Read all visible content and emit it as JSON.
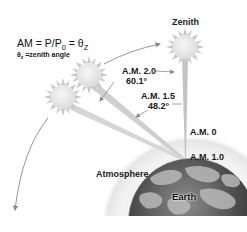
{
  "formula": {
    "main": "AM = P/P",
    "main_sub": "0",
    "main_tail": " = θ",
    "main_tail_sub": "Z",
    "definition_symbol": "θ",
    "definition_symbol_sub": "z",
    "definition_text": " =zenith angle"
  },
  "labels": {
    "zenith": "Zenith",
    "am20": "A.M. 2.0",
    "angle_601": "60.1°",
    "am15": "A.M. 1.5",
    "angle_482": "48.2°",
    "am0": "A.M. 0",
    "am10": "A.M. 1.0",
    "atmosphere": "Atmosphere",
    "earth": "Earth"
  },
  "icons": {
    "sun_zenith": "sun-icon",
    "sun_am15": "sun-icon",
    "sun_am20": "sun-icon",
    "earth": "globe-icon"
  },
  "colors": {
    "sun_fill": "#e9e9e9",
    "sun_rays": "#c8c8c8",
    "beam": "#c4c4c4",
    "arrow": "#8a8a8a",
    "atmosphere": "#eeeeee",
    "earth_dark": "#3a3a3a",
    "earth_light": "#b9b9b9"
  }
}
